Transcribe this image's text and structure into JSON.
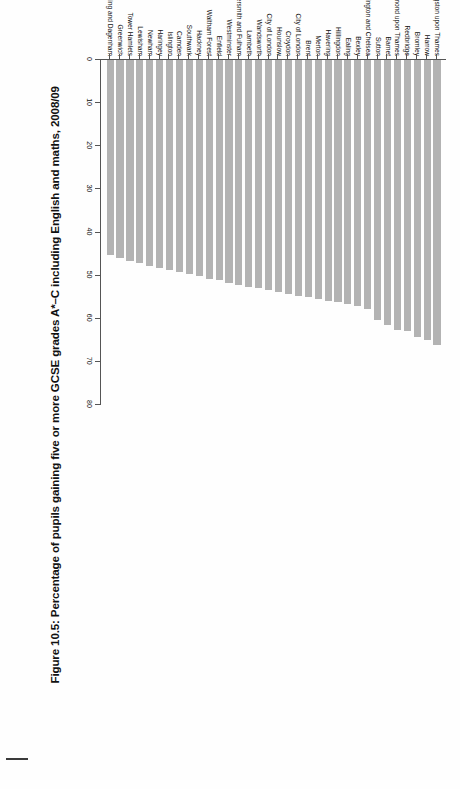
{
  "figure": {
    "title": "Figure 10.5: Percentage of pupils gaining five or more GCSE grades A*–C including English and maths, 2008/09"
  },
  "colors": {
    "bar_fill": "#b3b3b3",
    "axis": "#555555",
    "text": "#111111",
    "page_background": "#fefefe"
  },
  "chart_data": {
    "type": "bar",
    "orientation": "horizontal",
    "title": "Figure 10.5: Percentage of pupils gaining five or more GCSE grades A*–C including English and maths, 2008/09",
    "xlabel": "",
    "ylabel": "",
    "xlim": [
      0,
      80
    ],
    "xticks": [
      0,
      10,
      20,
      30,
      40,
      50,
      60,
      70,
      80
    ],
    "xtick_labels": [
      "0",
      "10",
      "20",
      "30",
      "40",
      "50",
      "60",
      "70",
      "80"
    ],
    "grid": false,
    "legend": "none",
    "series_name": "Percentage of pupils",
    "categories": [
      "Kingston upon Thames",
      "Harrow",
      "Bromley",
      "Redbridge",
      "Richmond upon Thames",
      "Barnet",
      "Sutton",
      "Kensington and Chelsea",
      "Bexley",
      "Ealing",
      "Hillingdon",
      "Havering",
      "Merton",
      "Brent",
      "City of London",
      "Croydon",
      "Hounslow",
      "City of London",
      "Wandsworth",
      "Lambeth",
      "Hammersmith and Fulham",
      "Westminster",
      "Enfield",
      "Waltham Forest",
      "Hackney",
      "Southwark",
      "Camden",
      "Islington",
      "Haringey",
      "Newham",
      "Lewisham",
      "Tower Hamlets",
      "Greenwich",
      "Barking and Dagenham"
    ],
    "values": [
      66.4,
      65.1,
      64.4,
      63.0,
      62.9,
      61.6,
      60.6,
      57.9,
      57.3,
      56.8,
      56.4,
      56.1,
      55.7,
      55.3,
      54.9,
      54.4,
      54.0,
      53.6,
      53.2,
      52.8,
      52.4,
      52.0,
      51.3,
      50.9,
      50.3,
      49.9,
      49.4,
      48.9,
      48.4,
      48.0,
      47.3,
      46.8,
      46.2,
      45.4
    ]
  },
  "axis": {
    "tick_labels": [
      "80",
      "70",
      "60",
      "50",
      "40",
      "30",
      "20",
      "10",
      "0"
    ]
  }
}
